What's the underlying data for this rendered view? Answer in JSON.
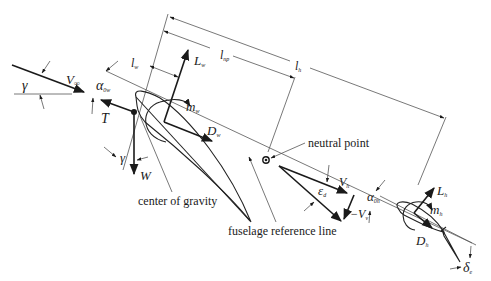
{
  "diagram": {
    "type": "aircraft longitudinal free-body diagram",
    "background": "#ffffff",
    "line_color": "#1a1a1a",
    "labels": {
      "gamma_top": "γ",
      "v_inf": "V",
      "v_inf_sub": "∞",
      "alpha_0w": "α",
      "alpha_0w_sub": "0w",
      "thrust": "T",
      "l_w": "l",
      "l_w_sub": "w",
      "l_np": "l",
      "l_np_sub": "np",
      "l_h": "l",
      "l_h_sub": "h",
      "lift_wing": "L",
      "lift_wing_sub": "w",
      "moment_wing": "m",
      "moment_wing_sub": "w",
      "drag_wing": "D",
      "drag_wing_sub": "w",
      "gamma_bottom": "γ",
      "weight": "W",
      "center_of_gravity": "center of gravity",
      "neutral_point": "neutral point",
      "fuselage_reference_line": "fuselage reference line",
      "v_h": "V",
      "v_h_sub": "h",
      "epsilon_d": "ε",
      "epsilon_d_sub": "d",
      "minus_v_v": "−V",
      "minus_v_v_sub": "v",
      "alpha_0h": "α",
      "alpha_0h_sub": "0h",
      "lift_tail": "L",
      "lift_tail_sub": "h",
      "moment_tail": "m",
      "moment_tail_sub": "h",
      "drag_tail": "D",
      "drag_tail_sub": "h",
      "elevator_deflection": "δ",
      "elevator_deflection_sub": "e"
    }
  }
}
